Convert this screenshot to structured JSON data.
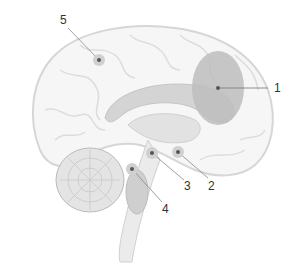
{
  "diagram": {
    "type": "brain-sagittal-section",
    "colors": {
      "outline": "#d4d4d4",
      "fill": "#f6f6f6",
      "region_dark": "#c8c8c8",
      "region_mid": "#dadada",
      "highlight_region": "#bdbdbd",
      "marker": "#555555",
      "leader": "#777777"
    },
    "callouts": [
      {
        "number": "1",
        "label_x": 278,
        "label_y": 111,
        "point_x": 218,
        "point_y": 88
      },
      {
        "number": "2",
        "label_x": 209,
        "label_y": 186,
        "point_x": 178,
        "point_y": 152
      },
      {
        "number": "3",
        "label_x": 184,
        "label_y": 186,
        "point_x": 152,
        "point_y": 153
      },
      {
        "number": "4",
        "label_x": 165,
        "label_y": 207,
        "point_x": 132,
        "point_y": 169
      },
      {
        "number": "5",
        "label_x": 60,
        "label_y": 14,
        "point_x": 99,
        "point_y": 60
      }
    ]
  }
}
